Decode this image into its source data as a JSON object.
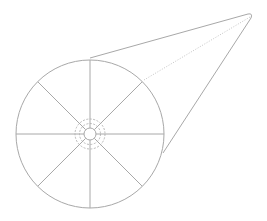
{
  "diagram": {
    "wheel": {
      "spoke_count": 8,
      "hub": {
        "solid_rings": 1,
        "dashed_rings": 2
      }
    },
    "funnel": {
      "edges": [
        "solid-upper-tangent",
        "solid-lower-tangent",
        "dotted-center-line"
      ]
    },
    "colors": {
      "stroke": "#a8a8a8",
      "dashed_stroke": "#b0b0b0",
      "dotted_stroke": "#bdbdbd",
      "background": "#ffffff"
    }
  }
}
